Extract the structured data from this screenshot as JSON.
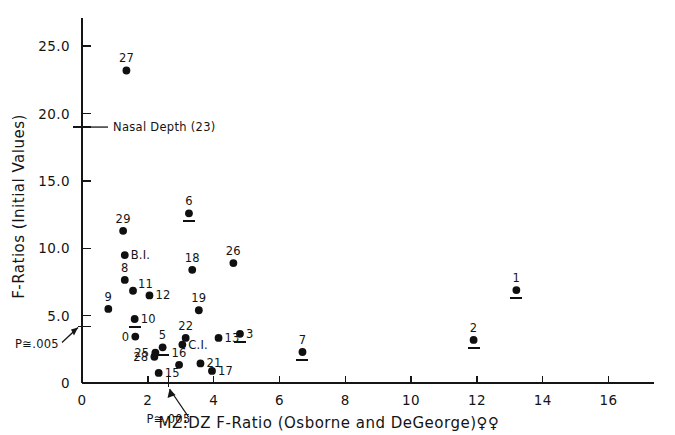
{
  "chart_data": {
    "type": "scatter",
    "title": "",
    "xlabel": "MZ:DZ  F-Ratio (Osborne and DeGeorge)♀♀",
    "ylabel": "F-Ratios (Initial Values)",
    "xlim": [
      0,
      17.2
    ],
    "ylim": [
      0,
      26.8
    ],
    "xticks": [
      0,
      2,
      4,
      6,
      8,
      10,
      12,
      14,
      16
    ],
    "xticklabels": [
      "0",
      "2",
      "4",
      "6",
      "8",
      "10",
      "12",
      "14",
      "16"
    ],
    "yticks": [
      0,
      5.0,
      10.0,
      15.0,
      20.0,
      25.0
    ],
    "yticklabels": [
      "0",
      "5.0",
      "10.0",
      "15.0",
      "20.0",
      "25.0"
    ],
    "grid": false,
    "legend": "none",
    "points": [
      {
        "label": "27",
        "x": 1.35,
        "y": 23.2,
        "label_pos": "above",
        "underline": false
      },
      {
        "label": "29",
        "x": 1.25,
        "y": 11.3,
        "label_pos": "above",
        "underline": false
      },
      {
        "label": "6",
        "x": 3.25,
        "y": 12.6,
        "label_pos": "above",
        "underline": true
      },
      {
        "label": "B.I.",
        "x": 1.3,
        "y": 9.5,
        "label_pos": "right",
        "underline": false
      },
      {
        "label": "26",
        "x": 4.6,
        "y": 8.9,
        "label_pos": "above",
        "underline": false
      },
      {
        "label": "18",
        "x": 3.35,
        "y": 8.4,
        "label_pos": "above",
        "underline": false
      },
      {
        "label": "8",
        "x": 1.3,
        "y": 7.65,
        "label_pos": "above",
        "underline": false
      },
      {
        "label": "11",
        "x": 1.55,
        "y": 6.85,
        "label_pos": "right-above",
        "underline": false
      },
      {
        "label": "1",
        "x": 13.2,
        "y": 6.9,
        "label_pos": "above",
        "underline": true
      },
      {
        "label": "12",
        "x": 2.05,
        "y": 6.5,
        "label_pos": "right",
        "underline": false
      },
      {
        "label": "9",
        "x": 0.8,
        "y": 5.5,
        "label_pos": "above",
        "underline": false
      },
      {
        "label": "19",
        "x": 3.55,
        "y": 5.4,
        "label_pos": "above",
        "underline": false
      },
      {
        "label": "10",
        "x": 1.6,
        "y": 4.75,
        "label_pos": "right",
        "underline": true
      },
      {
        "label": "3",
        "x": 4.8,
        "y": 3.65,
        "label_pos": "right",
        "underline": true
      },
      {
        "label": "0",
        "x": 1.62,
        "y": 3.45,
        "label_pos": "left",
        "underline": false
      },
      {
        "label": "22",
        "x": 3.15,
        "y": 3.35,
        "label_pos": "above",
        "underline": false
      },
      {
        "label": "13",
        "x": 4.15,
        "y": 3.35,
        "label_pos": "right",
        "underline": false
      },
      {
        "label": "2",
        "x": 11.9,
        "y": 3.2,
        "label_pos": "above",
        "underline": true
      },
      {
        "label": "C.I.",
        "x": 3.05,
        "y": 2.85,
        "label_pos": "right",
        "underline": false
      },
      {
        "label": "5",
        "x": 2.45,
        "y": 2.65,
        "label_pos": "above",
        "underline": true
      },
      {
        "label": "7",
        "x": 6.7,
        "y": 2.3,
        "label_pos": "above",
        "underline": true
      },
      {
        "label": "25",
        "x": 2.23,
        "y": 2.25,
        "label_pos": "left",
        "underline": false
      },
      {
        "label": "28",
        "x": 2.2,
        "y": 1.95,
        "label_pos": "left",
        "underline": false
      },
      {
        "label": "16",
        "x": 2.95,
        "y": 1.35,
        "label_pos": "above",
        "underline": false
      },
      {
        "label": "21",
        "x": 3.6,
        "y": 1.45,
        "label_pos": "right",
        "underline": false
      },
      {
        "label": "17",
        "x": 3.95,
        "y": 0.9,
        "label_pos": "right",
        "underline": false
      },
      {
        "label": "15",
        "x": 2.33,
        "y": 0.75,
        "label_pos": "right",
        "underline": false
      }
    ],
    "annotations": [
      {
        "name": "nasal-depth",
        "text": "Nasal Depth (23)",
        "axis": "y",
        "value": 19.0
      },
      {
        "name": "p-value-y",
        "text": "P≅.005",
        "axis": "y",
        "value": 4.2
      },
      {
        "name": "p-value-x",
        "text": "P≅.005",
        "axis": "x",
        "value": 2.63
      }
    ]
  }
}
